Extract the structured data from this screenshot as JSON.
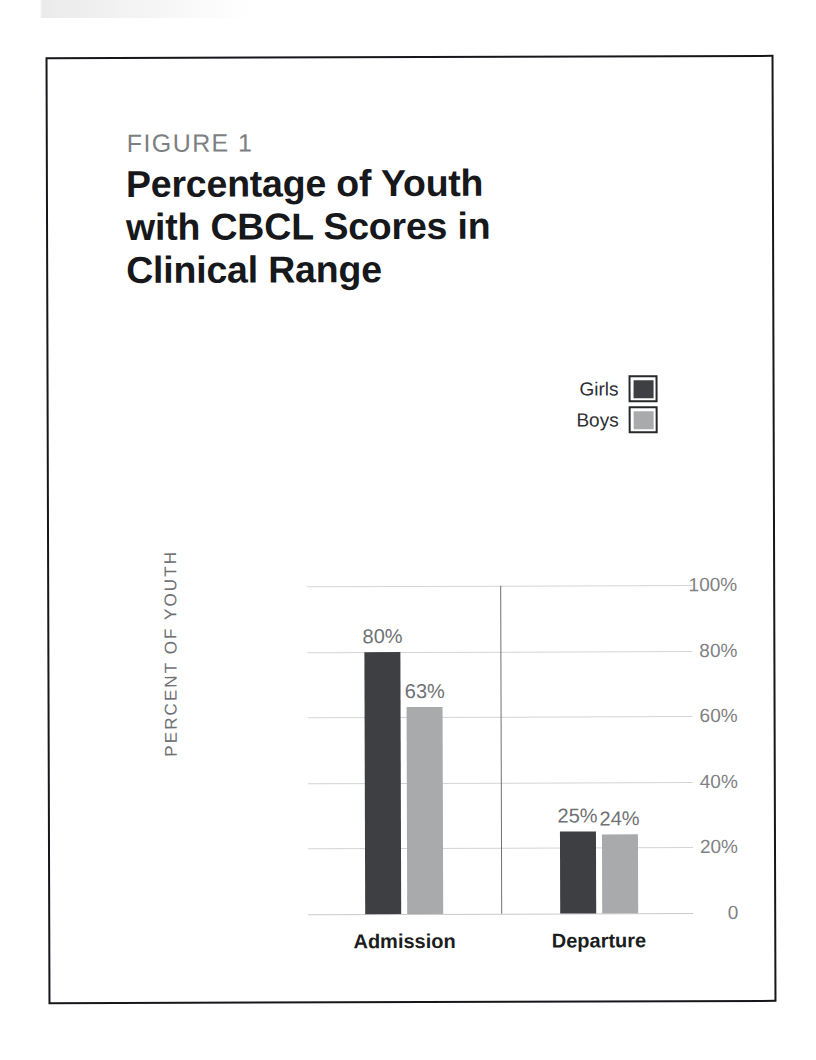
{
  "figure": {
    "label": "FIGURE 1",
    "title": "Percentage of Youth with CBCL Scores in Clinical Range"
  },
  "legend": {
    "items": [
      {
        "label": "Girls",
        "color": "#3d3f42"
      },
      {
        "label": "Boys",
        "color": "#a9aaac"
      }
    ]
  },
  "chart_data": {
    "type": "bar",
    "title": "Percentage of Youth with CBCL Scores in Clinical Range",
    "xlabel": "",
    "ylabel": "PERCENT OF YOUTH",
    "categories": [
      "Admission",
      "Departure"
    ],
    "series": [
      {
        "name": "Girls",
        "color": "#3d3f42",
        "values": [
          80,
          25
        ],
        "labels": [
          "80%",
          "24%"
        ]
      },
      {
        "name": "Boys",
        "color": "#a9aaac",
        "values": [
          63,
          24
        ],
        "labels": [
          "63%",
          "24%"
        ]
      }
    ],
    "value_labels": {
      "admission_girls": "80%",
      "admission_boys": "63%",
      "departure_girls": "25%",
      "departure_boys": "24%"
    },
    "ylim": [
      0,
      100
    ],
    "yticks": [
      100,
      80,
      60,
      40,
      20,
      0
    ],
    "ytick_labels": [
      "100%",
      "80%",
      "60%",
      "40%",
      "20%",
      "0"
    ],
    "grid": true,
    "legend_position": "top-right",
    "group_divider": true
  }
}
